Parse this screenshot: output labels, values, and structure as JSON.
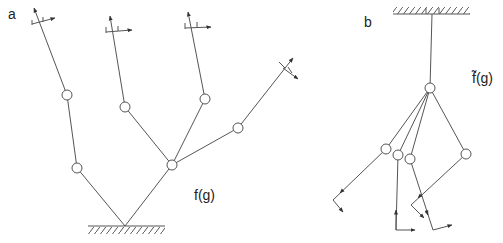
{
  "panels": [
    {
      "id": "a",
      "label": "a",
      "function_label": "f(g)",
      "description": "Branching kinematic tree fixed to ground at bottom, with end-effector frames at each of 4 tips"
    },
    {
      "id": "b",
      "label": "b",
      "function_label": "f̃(g)",
      "description": "Inverted tree hanging from ceiling with 4 legs, each ending in a frame"
    }
  ],
  "colors": {
    "line": "#555555",
    "text": "#222222",
    "background": "#ffffff"
  },
  "geometry": {
    "a": {
      "ground": {
        "x1": 88,
        "x2": 165,
        "y": 226
      },
      "base": [
        125,
        226
      ],
      "joints": [
        [
          77,
          168
        ],
        [
          67,
          95
        ],
        [
          172,
          165
        ],
        [
          125,
          107
        ],
        [
          205,
          99
        ],
        [
          238,
          128
        ]
      ],
      "links": [
        [
          [
            125,
            226
          ],
          [
            77,
            168
          ]
        ],
        [
          [
            77,
            168
          ],
          [
            67,
            95
          ]
        ],
        [
          [
            67,
            95
          ],
          [
            34,
            8
          ]
        ],
        [
          [
            125,
            226
          ],
          [
            172,
            165
          ]
        ],
        [
          [
            172,
            165
          ],
          [
            125,
            107
          ]
        ],
        [
          [
            125,
            107
          ],
          [
            110,
            18
          ]
        ],
        [
          [
            172,
            165
          ],
          [
            205,
            99
          ]
        ],
        [
          [
            205,
            99
          ],
          [
            188,
            15
          ]
        ],
        [
          [
            172,
            165
          ],
          [
            238,
            128
          ]
        ],
        [
          [
            238,
            128
          ],
          [
            290,
            62
          ]
        ]
      ],
      "tips": [
        [
          34,
          8
        ],
        [
          110,
          18
        ],
        [
          188,
          15
        ],
        [
          290,
          62
        ]
      ]
    },
    "b": {
      "ceiling": {
        "x1": 393,
        "x2": 470,
        "y": 14
      },
      "pivot": [
        432,
        14
      ],
      "hub": [
        430,
        88
      ],
      "joints": [
        [
          430,
          88
        ],
        [
          386,
          149
        ],
        [
          398,
          155
        ],
        [
          410,
          159
        ],
        [
          466,
          154
        ]
      ],
      "links": [
        [
          [
            432,
            14
          ],
          [
            430,
            88
          ]
        ],
        [
          [
            430,
            88
          ],
          [
            386,
            149
          ]
        ],
        [
          [
            386,
            149
          ],
          [
            333,
            200
          ]
        ],
        [
          [
            430,
            88
          ],
          [
            398,
            155
          ]
        ],
        [
          [
            398,
            155
          ],
          [
            396,
            230
          ]
        ],
        [
          [
            430,
            88
          ],
          [
            410,
            159
          ]
        ],
        [
          [
            410,
            159
          ],
          [
            433,
            230
          ]
        ],
        [
          [
            430,
            88
          ],
          [
            466,
            154
          ]
        ],
        [
          [
            466,
            154
          ],
          [
            411,
            205
          ]
        ]
      ]
    }
  }
}
